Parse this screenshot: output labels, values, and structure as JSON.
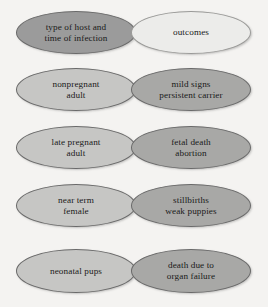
{
  "diagram": {
    "type": "flow-ellipse-matrix",
    "background_color": "#f4f3f1",
    "columns": [
      {
        "name": "host-column",
        "header": "type of  host and\ntime of infection"
      },
      {
        "name": "outcome-column",
        "header": "outcomes"
      }
    ],
    "nodes": [
      {
        "id": "host-header",
        "column": "left",
        "row": 0,
        "text": "type of  host and\ntime of infection",
        "fill": "#9b9b9b",
        "border": "#6a6a6a",
        "text_color": "#1a1a1a",
        "font_size": "9.2px"
      },
      {
        "id": "outcomes-header",
        "column": "right",
        "row": 0,
        "text": "outcomes",
        "fill": "#ececea",
        "border": "#9a9a98",
        "text_color": "#1a1a1a",
        "font_size": "9.2px"
      },
      {
        "id": "nonpregnant-adult",
        "column": "left",
        "row": 1,
        "text": "nonpregnant\nadult",
        "fill": "#c6c6c4",
        "border": "#6a6a6a",
        "text_color": "#1a1a1a",
        "font_size": "9.2px"
      },
      {
        "id": "mild-signs-persistent-carrier",
        "column": "right",
        "row": 1,
        "text": "mild signs\npersistent carrier",
        "fill": "#a8a8a6",
        "border": "#6a6a6a",
        "text_color": "#1a1a1a",
        "font_size": "9.2px"
      },
      {
        "id": "late-pregnant-adult",
        "column": "left",
        "row": 2,
        "text": "late pregnant\nadult",
        "fill": "#c6c6c4",
        "border": "#6a6a6a",
        "text_color": "#1a1a1a",
        "font_size": "9.2px"
      },
      {
        "id": "fetal-death-abortion",
        "column": "right",
        "row": 2,
        "text": "fetal death\nabortion",
        "fill": "#a8a8a6",
        "border": "#6a6a6a",
        "text_color": "#1a1a1a",
        "font_size": "9.2px"
      },
      {
        "id": "near-term-female",
        "column": "left",
        "row": 3,
        "text": "near term\nfemale",
        "fill": "#c6c6c4",
        "border": "#6a6a6a",
        "text_color": "#1a1a1a",
        "font_size": "9.2px"
      },
      {
        "id": "stillbirths-weak-puppies",
        "column": "right",
        "row": 3,
        "text": "stillbirths\nweak puppies",
        "fill": "#a8a8a6",
        "border": "#6a6a6a",
        "text_color": "#1a1a1a",
        "font_size": "9.2px"
      },
      {
        "id": "neonatal-pups",
        "column": "left",
        "row": 4,
        "text": "neonatal pups",
        "fill": "#c6c6c4",
        "border": "#6a6a6a",
        "text_color": "#1a1a1a",
        "font_size": "9.2px"
      },
      {
        "id": "death-due-to-organ-failure",
        "column": "right",
        "row": 4,
        "text": "death due to\norgan failure",
        "fill": "#a8a8a6",
        "border": "#6a6a6a",
        "text_color": "#1a1a1a",
        "font_size": "9.2px"
      }
    ]
  }
}
